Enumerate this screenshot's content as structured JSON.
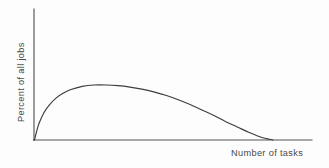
{
  "chart_data": {
    "type": "line",
    "title": "",
    "subtitle": "",
    "xlabel": "Number of tasks",
    "ylabel": "Percent of all jobs",
    "legend": [],
    "legend_position": "none",
    "grid": false,
    "xticks": [],
    "yticks": [],
    "xtick_labels": [],
    "ytick_labels": [],
    "xlim": [
      0,
      100
    ],
    "ylim": [
      0,
      100
    ],
    "annotations": [],
    "series": [
      {
        "name": "Distribution of jobs by number of tasks",
        "x": [
          0,
          1,
          2,
          4,
          6,
          9,
          12,
          15,
          20,
          25,
          30,
          35,
          40,
          45,
          50,
          55,
          60,
          65,
          70,
          75,
          80,
          85,
          90,
          95,
          100
        ],
        "y": [
          0,
          14,
          25,
          40,
          50,
          61,
          68,
          73,
          78,
          80,
          80,
          79,
          77,
          74,
          70,
          65,
          59,
          52,
          44,
          36,
          27,
          19,
          11,
          4,
          0
        ]
      }
    ]
  },
  "figure": {
    "caption": "",
    "axes": {
      "y_axis_name": "vertical-axis",
      "x_axis_name": "horizontal-axis"
    }
  }
}
